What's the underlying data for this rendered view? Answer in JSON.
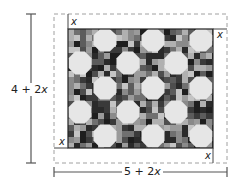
{
  "diagram": {
    "outer_rect": {
      "style": "dashed",
      "color": "#9a9a9a"
    },
    "quilt": {
      "fill": "#4a4a4a",
      "pattern": "octagon (snowball) blocks in staggered rows",
      "octagon_color": "#e6e6e6",
      "rows": [
        {
          "y": 40,
          "centers_x": [
            105,
            153,
            201
          ]
        },
        {
          "y": 63,
          "centers_x": [
            80,
            128,
            176
          ]
        },
        {
          "y": 88,
          "centers_x": [
            105,
            153,
            201
          ]
        },
        {
          "y": 112,
          "centers_x": [
            80,
            128,
            176
          ]
        },
        {
          "y": 136,
          "centers_x": [
            105,
            153,
            201
          ]
        }
      ]
    },
    "border_labels": {
      "top_left": "x",
      "top_right": "x",
      "bottom_left": "x",
      "bottom_right": "x"
    },
    "dimensions": {
      "height_label": "4 + 2x",
      "height_label_parts": {
        "num": "4 + 2",
        "var": "x"
      },
      "width_label": "5 + 2x",
      "width_label_parts": {
        "num": "5 + 2",
        "var": "x"
      }
    }
  }
}
